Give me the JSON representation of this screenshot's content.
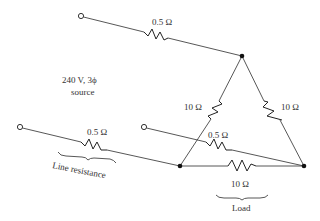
{
  "diagram": {
    "type": "three-phase delta load with line resistance",
    "source": {
      "line1": "240 V, 3ϕ",
      "line2": "source"
    },
    "line_resistors": [
      {
        "label": "0.5 Ω",
        "line": "top"
      },
      {
        "label": "0.5 Ω",
        "line": "left"
      },
      {
        "label": "0.5 Ω",
        "line": "middle"
      }
    ],
    "load_resistors": [
      {
        "label": "10 Ω",
        "branch": "left"
      },
      {
        "label": "10 Ω",
        "branch": "right"
      },
      {
        "label": "10 Ω",
        "branch": "bottom"
      }
    ],
    "annotations": {
      "line_resistance": "Line resistance",
      "load": "Load"
    }
  }
}
